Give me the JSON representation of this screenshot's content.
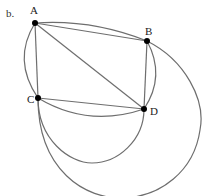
{
  "figure": {
    "label": "b.",
    "points": [
      {
        "name": "A",
        "x": 35,
        "y": 23,
        "label_x": 30,
        "label_y": 14
      },
      {
        "name": "B",
        "x": 147,
        "y": 41,
        "label_x": 145,
        "label_y": 35
      },
      {
        "name": "C",
        "x": 38,
        "y": 98,
        "label_x": 27,
        "label_y": 103
      },
      {
        "name": "D",
        "x": 144,
        "y": 109,
        "label_x": 150,
        "label_y": 115
      }
    ],
    "segments": [
      "AB",
      "AC",
      "AD",
      "BD",
      "CD"
    ],
    "arcs": [
      "A-B upper",
      "A-C left",
      "B-D right",
      "C-D lower shallow",
      "C-D lower semicircle",
      "B-C large outer"
    ],
    "colors": {
      "stroke": "#6e6e6e",
      "point": "#000000",
      "text": "#222222"
    }
  }
}
